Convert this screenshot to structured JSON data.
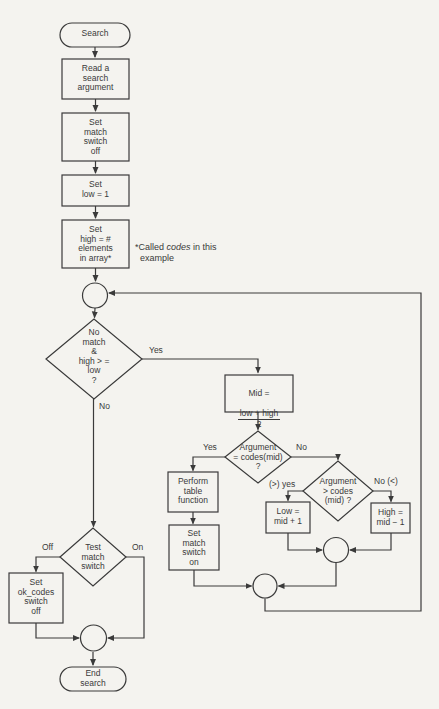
{
  "theme": {
    "background": "#f4f3ef",
    "ink": "#3a3a3a"
  },
  "diagram_title": "Binary search flowchart",
  "nodes": {
    "start": {
      "label": "Search"
    },
    "read": {
      "label": "Read a\nsearch\nargument"
    },
    "set_match_off": {
      "label": "Set\nmatch\nswitch\noff"
    },
    "set_low": {
      "label": "Set\nlow = 1"
    },
    "set_high": {
      "label": "Set\nhigh = #\nelements\nin array*"
    },
    "no_match_decision": {
      "label": "No\nmatch\n&\nhigh > =\nlow\n?"
    },
    "mid": {
      "line1": "Mid =",
      "numerator": "low + high",
      "denominator": "2"
    },
    "argument_equal_decision": {
      "label": "Argument\n= codes(mid)\n?"
    },
    "perform_table": {
      "label": "Perform\ntable\nfunction"
    },
    "set_match_on": {
      "label": "Set\nmatch\nswitch\non"
    },
    "argument_greater_decision": {
      "label": "Argument\n> codes\n(mid) ?"
    },
    "set_low_mid": {
      "label": "Low =\nmid + 1"
    },
    "set_high_mid": {
      "label": "High =\nmid − 1"
    },
    "test_match_decision": {
      "label": "Test\nmatch\nswitch"
    },
    "set_ok_codes": {
      "label": "Set\nok_codes\nswitch\noff"
    },
    "end": {
      "label": "End\nsearch"
    }
  },
  "edge_labels": {
    "yes_main": "Yes",
    "no_main": "No",
    "yes_equal": "Yes",
    "no_equal": "No",
    "gt_yes": "(>) yes",
    "no_lt": "No (<)",
    "off": "Off",
    "on": "On"
  },
  "note": {
    "prefix": "*Called ",
    "emphasis": "codes",
    "suffix": " in this",
    "line2": "example"
  }
}
